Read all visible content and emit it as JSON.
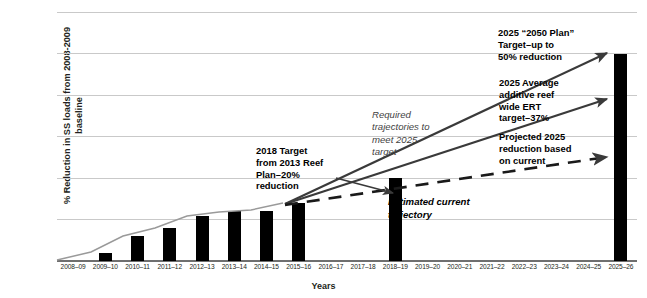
{
  "chart_data": {
    "type": "bar",
    "title": "",
    "xlabel": "Years",
    "ylabel": "% Reduction in SS loads from 2008-2009 baseline",
    "ylim": [
      0,
      60
    ],
    "yticks": [
      0,
      10,
      20,
      30,
      40,
      50,
      60
    ],
    "grid": true,
    "legend": "none",
    "categories": [
      "2008–09",
      "2009–10",
      "2010–11",
      "2011–12",
      "2012–13",
      "2013–14",
      "2014–15",
      "2015–16",
      "2016–17",
      "2017–18",
      "2018–19",
      "2019–20",
      "2020–21",
      "2021–22",
      "2022–23",
      "2023–24",
      "2024–25",
      "2025–26"
    ],
    "series": [
      {
        "name": "Reduction in SS loads",
        "type": "bar",
        "values": [
          0,
          2,
          6,
          8,
          11,
          12,
          12,
          14,
          null,
          null,
          20,
          null,
          null,
          null,
          null,
          null,
          null,
          50
        ]
      },
      {
        "name": "Observed cumulative trend",
        "type": "line",
        "style": "solid-grey",
        "points": [
          {
            "x": "2008–09",
            "y": 0
          },
          {
            "x": "2009–10",
            "y": 2
          },
          {
            "x": "2010–11",
            "y": 6
          },
          {
            "x": "2011–12",
            "y": 8
          },
          {
            "x": "2012–13",
            "y": 11
          },
          {
            "x": "2013–14",
            "y": 12
          },
          {
            "x": "2014–15",
            "y": 12.5
          },
          {
            "x": "2015–16",
            "y": 14
          }
        ]
      },
      {
        "name": "Required trajectory to 2050 Plan target",
        "type": "line",
        "style": "solid-dark-arrow",
        "points": [
          {
            "x": "2015–16",
            "y": 14
          },
          {
            "x": "2025–26",
            "y": 50
          }
        ]
      },
      {
        "name": "Required trajectory to average additive reef wide ERT target",
        "type": "line",
        "style": "solid-dark-arrow",
        "points": [
          {
            "x": "2015–16",
            "y": 14
          },
          {
            "x": "2025–26",
            "y": 37
          }
        ]
      },
      {
        "name": "Estimated current trajectory",
        "type": "line",
        "style": "dashed-arrow",
        "points": [
          {
            "x": "2015–16",
            "y": 14
          },
          {
            "x": "2025–26",
            "y": 23
          }
        ]
      }
    ],
    "annotations": [
      {
        "id": "target-2050-plan",
        "text": "2025 “2050 Plan”\nTarget–up to\n50% reduction",
        "style": "bold",
        "points_to": {
          "x": "2025–26",
          "y": 50
        }
      },
      {
        "id": "target-ert-37",
        "text": "2025 Average\nadditive reef\nwide ERT\ntarget–37%",
        "style": "bold",
        "points_to": {
          "x": "2025–26",
          "y": 37
        }
      },
      {
        "id": "projected-2025-reduction",
        "text": "Projected 2025\nreduction based\non current",
        "style": "bold",
        "points_to": {
          "x": "2025–26",
          "y": 23
        }
      },
      {
        "id": "target-2018-reef-plan",
        "text": "2018 Target\nfrom 2013 Reef\nPlan–20%\nreduction",
        "style": "bold",
        "points_to": {
          "x": "2018–19",
          "y": 20
        }
      },
      {
        "id": "required-trajectories",
        "text": "Required\ntrajectories to\nmeet 2025\ntarget",
        "style": "italic"
      },
      {
        "id": "estimated-current-trajectory",
        "text": "Estimated current\ntrajectory",
        "style": "bold-italic"
      }
    ]
  },
  "colors": {
    "bar": "#000000",
    "grid": "#c9c9c9",
    "axis": "#6f6f6f",
    "trend_line": "#9a9a9a",
    "arrow": "#3a3a3a",
    "text": "#231f20"
  }
}
